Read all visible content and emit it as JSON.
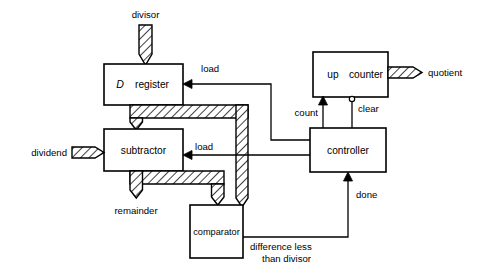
{
  "diagram": {
    "blocks": [
      {
        "id": "d_register",
        "label_italic": "D",
        "label_rest": "register",
        "x": 104,
        "y": 64,
        "w": 79,
        "h": 41
      },
      {
        "id": "subtractor",
        "label": "subtractor",
        "x": 104,
        "y": 129,
        "w": 79,
        "h": 42
      },
      {
        "id": "comparator",
        "label": "comparator",
        "x": 190,
        "y": 205,
        "w": 53,
        "h": 53
      },
      {
        "id": "up_counter",
        "label_a": "up",
        "label_b": "counter",
        "x": 313,
        "y": 52,
        "w": 75,
        "h": 45
      },
      {
        "id": "controller",
        "label": "controller",
        "x": 310,
        "y": 128,
        "w": 76,
        "h": 44
      }
    ],
    "signals": {
      "divisor": "divisor",
      "dividend": "dividend",
      "quotient": "quotient",
      "remainder": "remainder",
      "load_register": "load",
      "load_subtractor": "load",
      "count": "count",
      "clear": "clear",
      "done": "done",
      "difference_line1": "difference less",
      "difference_line2": "than  divisor"
    },
    "colors": {
      "stroke": "#000000",
      "background": "#ffffff",
      "hatch": "#000000"
    }
  }
}
